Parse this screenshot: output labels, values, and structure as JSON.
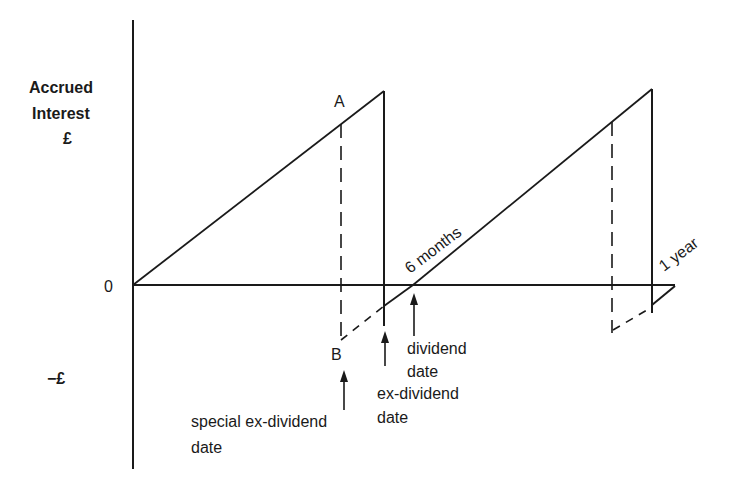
{
  "diagram": {
    "y_axis": {
      "label_line1": "Accrued",
      "label_line2": "Interest",
      "label_line3": "£",
      "zero": "0",
      "negative": "−£"
    },
    "points": {
      "a": "A",
      "b": "B"
    },
    "line_labels": {
      "six_months": "6 months",
      "one_year": "1 year"
    },
    "annotations": {
      "dividend_date_1": "dividend",
      "dividend_date_2": "date",
      "ex_dividend_1": "ex-dividend",
      "ex_dividend_2": "date",
      "special_ex_dividend_1": "special ex-dividend",
      "special_ex_dividend_2": "date"
    },
    "colors": {
      "ink": "#1a1a1a",
      "background": "#ffffff"
    }
  }
}
